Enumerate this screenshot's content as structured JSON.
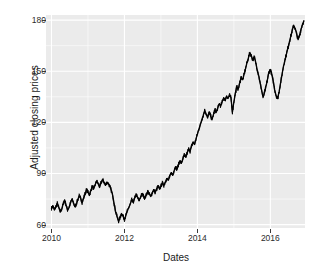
{
  "chart_data": {
    "type": "line",
    "title": "",
    "xlabel": "Dates",
    "ylabel": "Adjusted closing prices",
    "grid": true,
    "legend": "none",
    "xlim": [
      2009.85,
      2016.95
    ],
    "ylim": [
      58,
      183
    ],
    "x_ticks": [
      {
        "label": "2010",
        "value": 2010
      },
      {
        "label": "2012",
        "value": 2012
      },
      {
        "label": "2014",
        "value": 2014
      },
      {
        "label": "2016",
        "value": 2016
      }
    ],
    "y_ticks": [
      {
        "label": "180",
        "value": 180
      },
      {
        "label": "150",
        "value": 150
      },
      {
        "label": "120",
        "value": 120
      },
      {
        "label": "90",
        "value": 90
      },
      {
        "label": "60",
        "value": 60
      }
    ],
    "series": [
      {
        "name": "Adjusted closing price",
        "color": "#000000",
        "x": [
          2010.0,
          2010.04,
          2010.08,
          2010.12,
          2010.16,
          2010.2,
          2010.24,
          2010.28,
          2010.32,
          2010.36,
          2010.4,
          2010.44,
          2010.48,
          2010.52,
          2010.56,
          2010.6,
          2010.64,
          2010.68,
          2010.72,
          2010.76,
          2010.8,
          2010.84,
          2010.88,
          2010.92,
          2010.96,
          2011.0,
          2011.04,
          2011.08,
          2011.12,
          2011.16,
          2011.2,
          2011.24,
          2011.28,
          2011.32,
          2011.36,
          2011.4,
          2011.44,
          2011.48,
          2011.52,
          2011.56,
          2011.6,
          2011.64,
          2011.68,
          2011.72,
          2011.76,
          2011.8,
          2011.84,
          2011.88,
          2011.92,
          2011.96,
          2012.0,
          2012.04,
          2012.08,
          2012.12,
          2012.16,
          2012.2,
          2012.24,
          2012.28,
          2012.32,
          2012.36,
          2012.4,
          2012.44,
          2012.48,
          2012.52,
          2012.56,
          2012.6,
          2012.64,
          2012.68,
          2012.72,
          2012.76,
          2012.8,
          2012.84,
          2012.88,
          2012.92,
          2012.96,
          2013.0,
          2013.04,
          2013.08,
          2013.12,
          2013.16,
          2013.2,
          2013.24,
          2013.28,
          2013.32,
          2013.36,
          2013.4,
          2013.44,
          2013.48,
          2013.52,
          2013.56,
          2013.6,
          2013.64,
          2013.68,
          2013.72,
          2013.76,
          2013.8,
          2013.84,
          2013.88,
          2013.92,
          2013.96,
          2014.0,
          2014.04,
          2014.08,
          2014.12,
          2014.16,
          2014.2,
          2014.24,
          2014.28,
          2014.32,
          2014.36,
          2014.4,
          2014.44,
          2014.48,
          2014.52,
          2014.56,
          2014.6,
          2014.64,
          2014.68,
          2014.72,
          2014.76,
          2014.8,
          2014.84,
          2014.88,
          2014.92,
          2014.96,
          2015.0,
          2015.04,
          2015.08,
          2015.12,
          2015.16,
          2015.2,
          2015.24,
          2015.28,
          2015.32,
          2015.36,
          2015.4,
          2015.44,
          2015.48,
          2015.52,
          2015.56,
          2015.6,
          2015.64,
          2015.68,
          2015.72,
          2015.76,
          2015.8,
          2015.84,
          2015.88,
          2015.92,
          2015.96,
          2016.0,
          2016.04,
          2016.08,
          2016.12,
          2016.16,
          2016.2,
          2016.24,
          2016.28,
          2016.32,
          2016.36,
          2016.4,
          2016.44,
          2016.48,
          2016.52,
          2016.56,
          2016.6,
          2016.64,
          2016.68,
          2016.72,
          2016.76,
          2016.8,
          2016.84,
          2016.88,
          2016.92
        ],
        "y": [
          69.5,
          71.0,
          68.5,
          70.5,
          72.5,
          70.0,
          67.5,
          69.0,
          72.0,
          74.5,
          71.5,
          68.5,
          70.0,
          72.5,
          75.0,
          73.0,
          70.5,
          72.0,
          74.5,
          77.0,
          75.5,
          73.0,
          75.5,
          78.0,
          80.5,
          79.0,
          77.5,
          80.0,
          82.5,
          81.0,
          83.5,
          85.5,
          84.0,
          82.0,
          84.5,
          86.5,
          85.0,
          83.0,
          85.0,
          84.0,
          82.5,
          80.0,
          77.0,
          72.0,
          67.5,
          64.5,
          62.0,
          64.0,
          66.5,
          65.0,
          63.0,
          65.5,
          68.0,
          70.0,
          72.0,
          74.5,
          73.0,
          75.5,
          77.5,
          76.0,
          74.0,
          76.0,
          78.0,
          77.0,
          75.5,
          77.5,
          79.5,
          78.0,
          76.5,
          78.5,
          80.5,
          79.0,
          80.5,
          82.5,
          81.0,
          82.5,
          84.5,
          83.0,
          85.0,
          87.0,
          86.0,
          88.0,
          90.5,
          89.0,
          91.5,
          94.0,
          92.5,
          95.0,
          97.5,
          96.0,
          98.5,
          101.0,
          99.5,
          102.0,
          104.5,
          103.0,
          106.0,
          108.5,
          107.0,
          110.0,
          113.0,
          116.0,
          118.5,
          121.5,
          124.0,
          127.0,
          125.0,
          122.5,
          126.0,
          124.0,
          121.5,
          124.5,
          127.5,
          126.0,
          128.5,
          131.0,
          129.5,
          132.0,
          134.5,
          133.0,
          135.5,
          134.0,
          136.0,
          134.5,
          126.0,
          132.0,
          137.0,
          141.0,
          139.5,
          143.0,
          146.5,
          145.0,
          148.0,
          151.5,
          155.0,
          158.0,
          161.0,
          159.0,
          156.5,
          158.5,
          155.0,
          151.0,
          147.5,
          143.0,
          139.0,
          134.5,
          137.5,
          141.0,
          145.0,
          149.5,
          151.0,
          148.0,
          144.0,
          139.0,
          135.5,
          134.0,
          138.0,
          143.0,
          148.0,
          153.0,
          156.5,
          160.0,
          163.5,
          167.0,
          170.5,
          174.0,
          177.0,
          175.0,
          172.0,
          168.5,
          171.0,
          174.5,
          177.5,
          179.5
        ]
      }
    ]
  },
  "axis": {
    "y_title": "Adjusted closing prices",
    "x_title": "Dates"
  },
  "style": {
    "panel_background": "#ebebeb",
    "grid_color": "#ffffff",
    "line_color": "#000000",
    "text_color": "#1a1a1a"
  }
}
